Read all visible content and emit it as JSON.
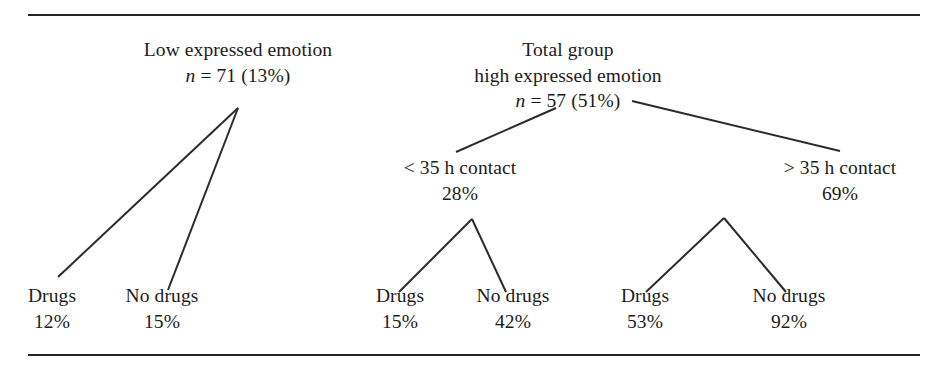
{
  "figure": {
    "background": "#ffffff",
    "line_color": "#2b2b2b",
    "rule_color": "#262626"
  },
  "nodes": {
    "low_ee": {
      "label_line1": "Low expressed emotion",
      "label_line2_prefix": "n",
      "label_line2_rest": " = 71 (13%)",
      "x": 238,
      "sample_size": 71,
      "percent": "13%"
    },
    "total_group": {
      "label_line1": "Total group",
      "label_line2": "high expressed emotion",
      "label_line3_prefix": "n",
      "label_line3_rest": " = 57 (51%)",
      "x": 568,
      "sample_size": 57,
      "percent": "51%"
    },
    "contact_lt35": {
      "label": "< 35 h contact",
      "value": "28%",
      "x": 460
    },
    "contact_gt35": {
      "label": "> 35 h contact",
      "value": "69%",
      "x": 840
    }
  },
  "leaves": [
    {
      "name": "low-ee-drugs",
      "label": "Drugs",
      "value": "12%",
      "x": 52
    },
    {
      "name": "low-ee-no-drugs",
      "label": "No drugs",
      "value": "15%",
      "x": 162
    },
    {
      "name": "lt35-drugs",
      "label": "Drugs",
      "value": "15%",
      "x": 400
    },
    {
      "name": "lt35-no-drugs",
      "label": "No drugs",
      "value": "42%",
      "x": 513
    },
    {
      "name": "gt35-drugs",
      "label": "Drugs",
      "value": "53%",
      "x": 645
    },
    {
      "name": "gt35-no-drugs",
      "label": "No drugs",
      "value": "92%",
      "x": 789
    }
  ],
  "connectors": [
    {
      "name": "low-ee-to-drugs",
      "x1": 238,
      "y1": 108,
      "x2": 58,
      "y2": 277
    },
    {
      "name": "low-ee-to-no-drugs",
      "x1": 238,
      "y1": 108,
      "x2": 168,
      "y2": 290
    },
    {
      "name": "total-to-lt35",
      "x1": 556,
      "y1": 108,
      "x2": 456,
      "y2": 152
    },
    {
      "name": "total-to-gt35",
      "x1": 632,
      "y1": 101,
      "x2": 840,
      "y2": 151
    },
    {
      "name": "lt35-to-drugs",
      "x1": 472,
      "y1": 219,
      "x2": 399,
      "y2": 292
    },
    {
      "name": "lt35-to-no-drugs",
      "x1": 472,
      "y1": 219,
      "x2": 506,
      "y2": 292
    },
    {
      "name": "gt35-to-drugs",
      "x1": 724,
      "y1": 218,
      "x2": 646,
      "y2": 292
    },
    {
      "name": "gt35-to-no-drugs",
      "x1": 724,
      "y1": 218,
      "x2": 786,
      "y2": 292
    }
  ],
  "rules": {
    "top_label": "top horizontal rule",
    "bottom_label": "bottom horizontal rule"
  }
}
